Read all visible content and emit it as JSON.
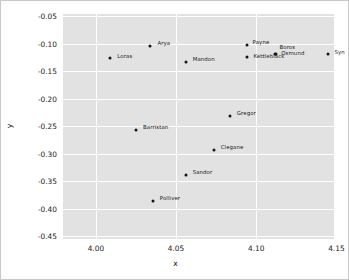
{
  "chart_data": {
    "type": "scatter",
    "title": "",
    "xlabel": "x",
    "ylabel": "y",
    "xlim": [
      3.9795,
      4.1485
    ],
    "ylim": [
      -0.4555,
      -0.0455
    ],
    "xticks": [
      "4.00",
      "4.05",
      "4.10",
      "4.15"
    ],
    "xtick_values": [
      4.0,
      4.05,
      4.1,
      4.15
    ],
    "yticks": [
      "-0.05",
      "-0.10",
      "-0.15",
      "-0.20",
      "-0.25",
      "-0.30",
      "-0.35",
      "-0.40",
      "-0.45"
    ],
    "ytick_values": [
      -0.05,
      -0.1,
      -0.15,
      -0.2,
      -0.25,
      -0.3,
      -0.35,
      -0.4,
      -0.45
    ],
    "grid": true,
    "legend": false,
    "panel_background": "#e2e2e2",
    "grid_color": "#ffffff",
    "point_color": "#141414",
    "points": [
      {
        "label": "Loras",
        "x": 4.009,
        "y": -0.1255,
        "label_dx": 7,
        "label_dy": -4
      },
      {
        "label": "Arya",
        "x": 4.034,
        "y": -0.103,
        "label_dx": 7,
        "label_dy": -5
      },
      {
        "label": "Mandon",
        "x": 4.056,
        "y": -0.133,
        "label_dx": 7,
        "label_dy": -5
      },
      {
        "label": "Payne",
        "x": 4.094,
        "y": -0.1025,
        "label_dx": 6,
        "label_dy": -5
      },
      {
        "label": "Kettleblack",
        "x": 4.0945,
        "y": -0.1245,
        "label_dx": 6,
        "label_dy": -3
      },
      {
        "label": "Boros",
        "x": 4.112,
        "y": -0.119,
        "label_dx": 4,
        "label_dy": -9
      },
      {
        "label": "Osmund",
        "x": 4.1125,
        "y": -0.1185,
        "label_dx": 5,
        "label_dy": -3
      },
      {
        "label": "Syn",
        "x": 4.145,
        "y": -0.119,
        "label_dx": 6,
        "label_dy": -4
      },
      {
        "label": "Gregor",
        "x": 4.0835,
        "y": -0.2305,
        "label_dx": 7,
        "label_dy": -5
      },
      {
        "label": "Barristan",
        "x": 4.025,
        "y": -0.2575,
        "label_dx": 7,
        "label_dy": -5
      },
      {
        "label": "Clegane",
        "x": 4.0735,
        "y": -0.294,
        "label_dx": 7,
        "label_dy": -5
      },
      {
        "label": "Sandor",
        "x": 4.056,
        "y": -0.338,
        "label_dx": 7,
        "label_dy": -5
      },
      {
        "label": "Polliver",
        "x": 4.0355,
        "y": -0.3855,
        "label_dx": 7,
        "label_dy": -5
      }
    ]
  }
}
